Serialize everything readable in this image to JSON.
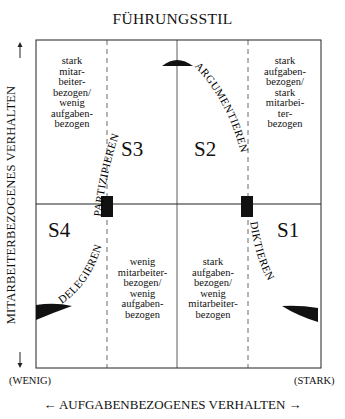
{
  "title": "FÜHRUNGSSTIL",
  "axes": {
    "y_label": "MITARBEITERBEZOGENES VERHALTEN",
    "x_label": "AUFGABENBEZOGENES VERHALTEN",
    "x_arrow_left": "←",
    "x_arrow_right": "→",
    "low_label": "(WENIG)",
    "high_label": "(STARK)"
  },
  "quadrants": [
    {
      "id": "S1",
      "label": "S1",
      "curve_label": "DIKTIEREN"
    },
    {
      "id": "S2",
      "label": "S2",
      "curve_label": "ARGUMENTIEREN"
    },
    {
      "id": "S3",
      "label": "S3",
      "curve_label": "PARTIZIPIEREN"
    },
    {
      "id": "S4",
      "label": "S4",
      "curve_label": "DELEGIEREN"
    }
  ],
  "cell_descriptions": {
    "top_left": [
      "stark",
      "mitar-",
      "beiter-",
      "bezogen/",
      "wenig",
      "aufgaben-",
      "bezogen"
    ],
    "top_right": [
      "stark",
      "aufgaben-",
      "bezogen/",
      "stark",
      "mitarbei-",
      "ter-",
      "bezogen"
    ],
    "bottom_mid_left": [
      "wenig",
      "mitarbeiter-",
      "bezogen/",
      "wenig",
      "aufgaben-",
      "bezogen"
    ],
    "bottom_mid_right": [
      "stark",
      "aufgaben-",
      "bezogen/",
      "wenig",
      "mitarbeiter-",
      "bezogen"
    ]
  },
  "colors": {
    "line": "#222222",
    "fill": "#111111",
    "background": "#ffffff"
  }
}
